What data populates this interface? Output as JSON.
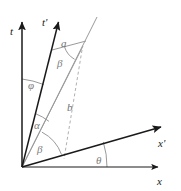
{
  "figure": {
    "type": "geometry-diagram",
    "width": 181,
    "height": 191,
    "background_color": "#ffffff"
  },
  "colors": {
    "axis_black": "#1a1a1a",
    "construction_gray": "#9a9a9a",
    "arc_gray": "#8d8d8d",
    "label_gray": "#7d7d7d",
    "dashed_gray": "#b0b0b0"
  },
  "axes": [
    {
      "id": "t-axis",
      "label": "t",
      "label_x": 10,
      "label_y": 35,
      "from": [
        22,
        167
      ],
      "to": [
        22,
        20
      ],
      "arrow": true,
      "style": "solid-black"
    },
    {
      "id": "t-prime-axis",
      "label": "t'",
      "label_x": 44,
      "label_y": 25,
      "from": [
        22,
        167
      ],
      "to": [
        59,
        20
      ],
      "arrow": true,
      "style": "solid-black"
    },
    {
      "id": "x-axis",
      "label": "x",
      "label_x": 159,
      "label_y": 184,
      "from": [
        22,
        167
      ],
      "to": [
        161,
        167
      ],
      "arrow": true,
      "style": "solid-black"
    },
    {
      "id": "x-prime-axis",
      "label": "x'",
      "label_x": 160,
      "label_y": 146,
      "from": [
        22,
        167
      ],
      "to": [
        164,
        126
      ],
      "arrow": true,
      "style": "solid-black"
    }
  ],
  "construction_lines": [
    {
      "id": "worldline-ray",
      "from": [
        22,
        167
      ],
      "to": [
        97,
        17
      ],
      "style": "solid-gray"
    },
    {
      "id": "segment-a",
      "from": [
        53,
        50
      ],
      "to": [
        85,
        41
      ],
      "style": "solid-gray"
    },
    {
      "id": "segment-b",
      "from": [
        22,
        167
      ],
      "to": [
        82,
        48
      ],
      "style": "solid-gray"
    },
    {
      "id": "drop-line",
      "from": [
        81,
        52
      ],
      "to": [
        64,
        158
      ],
      "style": "dashed-gray"
    }
  ],
  "segment_labels": [
    {
      "id": "segment-a-label",
      "text": "a",
      "x": 62,
      "y": 46
    },
    {
      "id": "segment-b-label",
      "text": "b",
      "x": 68,
      "y": 110
    }
  ],
  "angles": [
    {
      "id": "angle-phi",
      "symbol": "φ",
      "label_x": 29,
      "label_y": 88,
      "vertex": [
        22,
        167
      ],
      "radius": 88,
      "between": [
        "t-axis",
        "t-prime-axis"
      ]
    },
    {
      "id": "angle-beta-upper",
      "symbol": "β",
      "label_x": 58,
      "label_y": 66,
      "vertex": [
        85,
        41
      ],
      "radius": 22,
      "between": [
        "segment-a",
        "worldline-ray"
      ]
    },
    {
      "id": "angle-alpha",
      "symbol": "α",
      "label_x": 35,
      "label_y": 128,
      "vertex": [
        22,
        167
      ],
      "radius": 55,
      "between": [
        "t-prime-axis",
        "segment-b"
      ]
    },
    {
      "id": "angle-beta-lower",
      "symbol": "β",
      "label_x": 38,
      "label_y": 152,
      "vertex": [
        22,
        167
      ],
      "radius": 40,
      "between": [
        "segment-b",
        "x-prime-axis"
      ]
    },
    {
      "id": "angle-theta",
      "symbol": "θ",
      "label_x": 97,
      "label_y": 163,
      "vertex": [
        22,
        167
      ],
      "radius": 85,
      "between": [
        "x-axis",
        "x-prime-axis"
      ]
    }
  ]
}
